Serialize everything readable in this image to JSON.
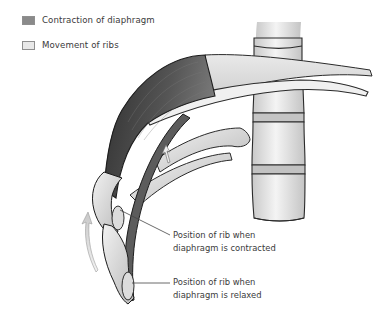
{
  "legend": {
    "items": [
      {
        "label": "Contraction of diaphragm",
        "swatch_color": "#8a8a8a",
        "icon": "dark-gray-swatch"
      },
      {
        "label": "Movement of ribs",
        "swatch_color": "#e6e6e6",
        "icon": "light-gray-swatch"
      }
    ]
  },
  "callouts": {
    "contracted": {
      "line1": "Position of rib when",
      "line2": "diaphragm is contracted"
    },
    "relaxed": {
      "line1": "Position of rib when",
      "line2": "diaphragm is relaxed"
    }
  },
  "colors": {
    "diaphragm_dark": "#3f3f3f",
    "diaphragm_mid": "#6a6a6a",
    "bone_light": "#e4e4e4",
    "bone_shadow": "#bdbdbd",
    "outline": "#222222",
    "arrow": "#d0d0d0"
  }
}
